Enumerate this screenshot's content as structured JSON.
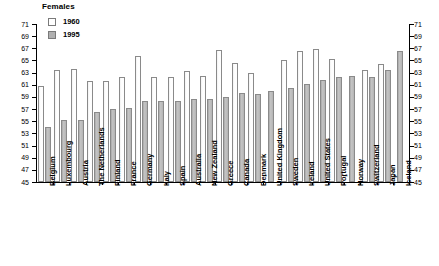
{
  "chart_data": {
    "type": "bar",
    "title": "Females",
    "xlabel": "",
    "ylabel": "",
    "ylim": [
      45,
      71
    ],
    "ytick_step": 2,
    "yticks": [
      45,
      47,
      49,
      51,
      53,
      55,
      57,
      59,
      61,
      63,
      65,
      67,
      69,
      71
    ],
    "grid": false,
    "legend_position": "top-left",
    "dual_axis": true,
    "note_symbol": "*",
    "categories": [
      "Belgium",
      "Luxembourg",
      "Austria",
      "The Netherlands",
      "Finland",
      "France",
      "Germany",
      "Italy",
      "Spain",
      "Australia",
      "New Zealand",
      "Greece",
      "Canada",
      "Denmark",
      "United Kingdom",
      "Sweden",
      "Ireland",
      "United States",
      "Portugal",
      "Norway",
      "Switzerland",
      "Japan",
      "Iceland"
    ],
    "series": [
      {
        "name": "1960",
        "color": "#ffffff",
        "values": [
          60.8,
          63.4,
          63.6,
          61.7,
          61.7,
          62.2,
          65.8,
          62.2,
          62.3,
          63.2,
          62.5,
          66.8,
          64.6,
          63.0,
          null,
          65.1,
          66.6,
          66.9,
          65.2,
          null,
          63.5,
          64.4,
          null
        ]
      },
      {
        "name": "1995",
        "color": "#b0b0b0",
        "values": [
          54.0,
          55.2,
          55.2,
          56.6,
          57.0,
          57.1,
          58.4,
          58.3,
          58.4,
          58.7,
          58.7,
          59.0,
          59.7,
          59.5,
          60.0,
          60.5,
          61.1,
          61.8,
          62.2,
          62.4,
          62.2,
          63.4,
          66.6
        ]
      }
    ],
    "asterisk_categories": [
      "United Kingdom",
      "Norway",
      "Iceland"
    ],
    "legend": [
      {
        "label": "1960",
        "swatch": "white"
      },
      {
        "label": "1995",
        "swatch": "gray"
      }
    ]
  }
}
